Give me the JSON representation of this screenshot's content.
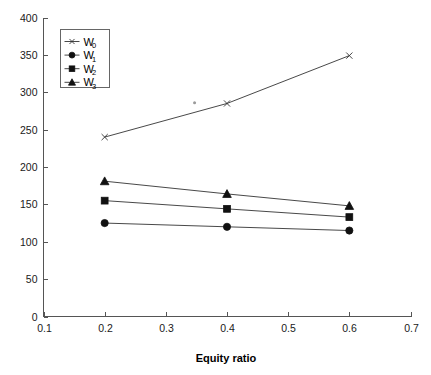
{
  "chart_data": {
    "type": "line",
    "title": "",
    "xlabel": "Equity ratio",
    "ylabel": "",
    "x": [
      0.2,
      0.4,
      0.6
    ],
    "xlim": [
      0.1,
      0.7
    ],
    "ylim": [
      0,
      400
    ],
    "xticks": [
      "0.1",
      "0.2",
      "0.3",
      "0.4",
      "0.5",
      "0.6",
      "0.7"
    ],
    "xtick_values": [
      0.1,
      0.2,
      0.3,
      0.4,
      0.5,
      0.6,
      0.7
    ],
    "yticks": [
      "0",
      "50",
      "100",
      "150",
      "200",
      "250",
      "300",
      "350",
      "400"
    ],
    "ytick_values": [
      0,
      50,
      100,
      150,
      200,
      250,
      300,
      350,
      400
    ],
    "grid": false,
    "legend_position": "upper-left-inside",
    "series": [
      {
        "name": "W0",
        "label_base": "W",
        "label_sub": "0",
        "marker": "x",
        "values": [
          240,
          285,
          349
        ]
      },
      {
        "name": "W1",
        "label_base": "W",
        "label_sub": "1",
        "marker": "circle",
        "values": [
          125,
          120,
          115
        ]
      },
      {
        "name": "W2",
        "label_base": "W",
        "label_sub": "2",
        "marker": "square",
        "values": [
          155,
          144,
          133
        ]
      },
      {
        "name": "W3",
        "label_base": "W",
        "label_sub": "3",
        "marker": "triangle",
        "values": [
          181,
          164,
          148
        ]
      }
    ],
    "annotations": [
      {
        "name": "stray-dot",
        "x": 0.347,
        "y": 286
      }
    ],
    "colors": {
      "background": "#ffffff",
      "axis": "#555555",
      "line": "#333333",
      "marker": "#111111",
      "text": "#000000"
    }
  }
}
